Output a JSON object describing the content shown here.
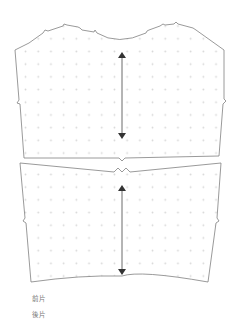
{
  "diagram": {
    "type": "sewing-pattern",
    "outline_color": "#808080",
    "dot_color": "#d6d6d6",
    "arrow_color": "#555555",
    "grid_spacing": 12.7,
    "pieces": [
      {
        "id": "front",
        "label": "前片",
        "grainline": {
          "x": 122,
          "y1": 51,
          "y2": 139
        }
      },
      {
        "id": "back",
        "label": "後片",
        "grainline": {
          "x": 122,
          "y1": 184,
          "y2": 276
        }
      }
    ]
  },
  "legend": {
    "items": [
      {
        "label": "前片"
      },
      {
        "label": "後片"
      }
    ]
  }
}
